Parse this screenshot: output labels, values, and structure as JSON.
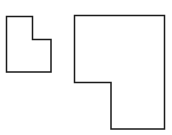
{
  "diagram": {
    "width": 172,
    "height": 135,
    "background": "#ffffff",
    "stroke_color": "#1a1a1a",
    "stroke_width": 1.5,
    "shapes": [
      {
        "id": "small-l-shape",
        "description": "small L-shaped polygon (notch cut from top-right)",
        "points": "6.5,16.5 32.5,16.5 32.5,39.5 51,39.5 51,72 6.5,72"
      },
      {
        "id": "large-l-shape",
        "description": "large L-shaped polygon (notch cut from bottom-left)",
        "points": "74.5,15.5 164.5,15.5 164.5,129 111,129 111,82.5 74.5,82.5"
      }
    ]
  }
}
